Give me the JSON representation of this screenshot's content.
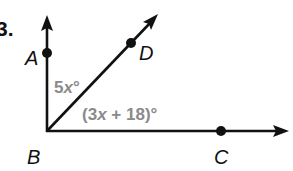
{
  "problem": {
    "number": "3."
  },
  "diagram": {
    "vertex": {
      "label": "B"
    },
    "points": [
      {
        "id": "A",
        "label": "A"
      },
      {
        "id": "D",
        "label": "D"
      },
      {
        "id": "C",
        "label": "C"
      }
    ],
    "rays": [
      "BA",
      "BD",
      "BC"
    ],
    "angles": [
      {
        "name": "angle-ABD",
        "label_main": "5",
        "label_var": "x",
        "label_end": "°"
      },
      {
        "name": "angle-DBC",
        "label_open": "(3",
        "label_var": "x",
        "label_rest": " + 18)°"
      }
    ],
    "colors": {
      "lines": "#111111",
      "angle_labels": "#8a8a8a",
      "background": "#ffffff"
    }
  }
}
